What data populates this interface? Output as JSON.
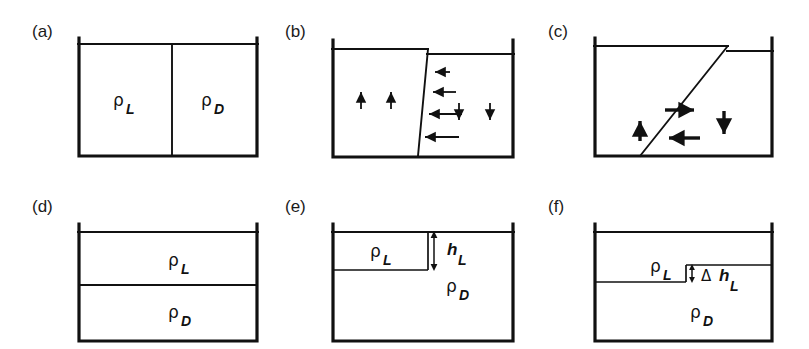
{
  "figure": {
    "caption_labels": [
      "(a)",
      "(b)",
      "(c)",
      "(d)",
      "(e)",
      "(f)"
    ],
    "symbols": {
      "rho": "ρ",
      "delta": "Δ",
      "h": "h",
      "sub_light": "L",
      "sub_dense": "D"
    },
    "colors": {
      "ink": "#111111",
      "background": "#ffffff"
    }
  },
  "panels": [
    {
      "id": "a",
      "letter": "(a)",
      "description": "vertical-barrier-lock-exchange-initial",
      "labels": [
        {
          "name": "density-light",
          "rho": "ρ",
          "sub": "L"
        },
        {
          "name": "density-dense",
          "rho": "ρ",
          "sub": "D"
        }
      ]
    },
    {
      "id": "b",
      "letter": "(b)",
      "description": "tilted-interface-with-flow-arrows",
      "labels": [],
      "arrows": {
        "up_count": 2,
        "down_count": 2,
        "left_count": 4
      }
    },
    {
      "id": "c",
      "letter": "(c)",
      "description": "strongly-tilted-interface-circulation",
      "labels": [],
      "arrows": {
        "up_count": 1,
        "right_count": 1,
        "down_count": 1,
        "left_count": 1
      }
    },
    {
      "id": "d",
      "letter": "(d)",
      "description": "two-layer-horizontal-stratification",
      "labels": [
        {
          "name": "density-light",
          "rho": "ρ",
          "sub": "L"
        },
        {
          "name": "density-dense",
          "rho": "ρ",
          "sub": "D"
        }
      ]
    },
    {
      "id": "e",
      "letter": "(e)",
      "description": "partial-light-layer-with-depth-h-L",
      "labels": [
        {
          "name": "density-light",
          "rho": "ρ",
          "sub": "L"
        },
        {
          "name": "density-dense",
          "rho": "ρ",
          "sub": "D"
        },
        {
          "name": "layer-depth",
          "h": "h",
          "sub": "L"
        }
      ]
    },
    {
      "id": "f",
      "letter": "(f)",
      "description": "stepped-interface-with-delta-h-L",
      "labels": [
        {
          "name": "density-light",
          "rho": "ρ",
          "sub": "L"
        },
        {
          "name": "density-dense",
          "rho": "ρ",
          "sub": "D"
        },
        {
          "name": "step-height",
          "delta": "Δ",
          "h": "h",
          "sub": "L"
        }
      ]
    }
  ]
}
